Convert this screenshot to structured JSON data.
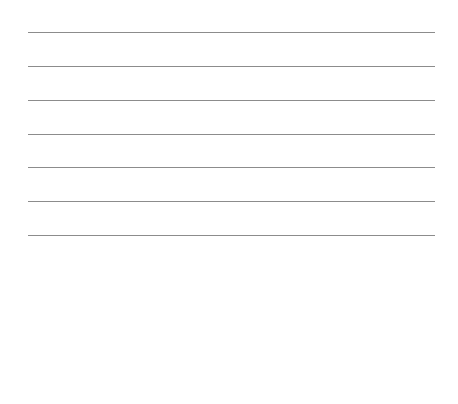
{
  "page": {
    "background": "#ffffff",
    "rule_color": "#8c8c8c",
    "rules": [
      {
        "y": 32
      },
      {
        "y": 66
      },
      {
        "y": 100
      },
      {
        "y": 134
      },
      {
        "y": 167
      },
      {
        "y": 201
      },
      {
        "y": 235
      }
    ]
  }
}
